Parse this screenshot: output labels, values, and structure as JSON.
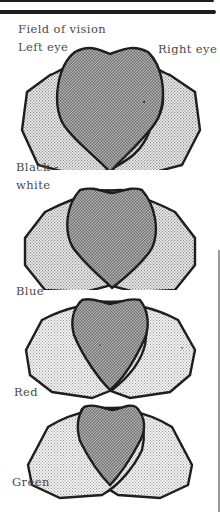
{
  "figure": {
    "title": "Field of vision",
    "left_label": "Left eye",
    "right_label": "Right eye",
    "panels": [
      {
        "label_line1": "Black -",
        "label_line2": "white",
        "stimulus": "black-white"
      },
      {
        "label": "Blue",
        "stimulus": "blue"
      },
      {
        "label": "Red",
        "stimulus": "red"
      },
      {
        "label": "Green",
        "stimulus": "green"
      }
    ]
  },
  "colors": {
    "outline": "#1e1e1e",
    "monocular_fill": "#d9d9d9",
    "binocular_fill": "#a9a9a9",
    "text": "#4a4a4a"
  }
}
